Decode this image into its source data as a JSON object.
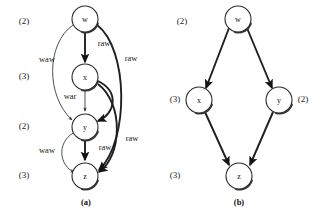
{
  "figure": {
    "panels": [
      {
        "id": "panel-a",
        "caption": "(a)",
        "nodes": [
          {
            "id": "w",
            "label": "w",
            "cx": 85,
            "cy": 19,
            "r": 13,
            "latency": "(2)",
            "latency_x": 24,
            "latency_y": 22,
            "latency_side": "left"
          },
          {
            "id": "x",
            "label": "x",
            "cx": 85,
            "cy": 77,
            "r": 13,
            "latency": "(3)",
            "latency_x": 24,
            "latency_y": 77,
            "latency_side": "left"
          },
          {
            "id": "y",
            "label": "y",
            "cx": 85,
            "cy": 127,
            "r": 13,
            "latency": "(2)",
            "latency_x": 24,
            "latency_y": 127,
            "latency_side": "left"
          },
          {
            "id": "z",
            "label": "z",
            "cx": 85,
            "cy": 176,
            "r": 13,
            "latency": "(3)",
            "latency_x": 24,
            "latency_y": 176,
            "latency_side": "left"
          }
        ],
        "edges": [
          {
            "id": "w-x-raw",
            "from": "w",
            "to": "x",
            "label": "raw",
            "label_x": 104,
            "label_y": 44,
            "weight": "thick"
          },
          {
            "id": "w-y-waw",
            "from": "w",
            "to": "y",
            "label": "waw",
            "label_x": 47,
            "label_y": 60,
            "weight": "thin"
          },
          {
            "id": "w-z-raw",
            "from": "w",
            "to": "z",
            "label": "raw",
            "label_x": 131,
            "label_y": 59,
            "weight": "thick"
          },
          {
            "id": "x-y-war",
            "from": "x",
            "to": "y",
            "label": "war",
            "label_x": 70,
            "label_y": 97,
            "weight": "thin"
          },
          {
            "id": "x-y-raw-curve",
            "from": "x",
            "to": "y",
            "label": "",
            "label_x": 0,
            "label_y": 0,
            "weight": "thick"
          },
          {
            "id": "y-z-raw",
            "from": "y",
            "to": "z",
            "label": "raw",
            "label_x": 105,
            "label_y": 148,
            "weight": "thick"
          },
          {
            "id": "y-z-waw",
            "from": "y",
            "to": "z",
            "label": "waw",
            "label_x": 47,
            "label_y": 151,
            "weight": "thin"
          },
          {
            "id": "x-z-raw",
            "from": "x",
            "to": "z",
            "label": "raw",
            "label_x": 132,
            "label_y": 139,
            "weight": "thick"
          }
        ]
      },
      {
        "id": "panel-b",
        "caption": "(b)",
        "nodes": [
          {
            "id": "w",
            "label": "w",
            "cx": 238,
            "cy": 19,
            "r": 13,
            "latency": "(2)",
            "latency_x": 182,
            "latency_y": 22,
            "latency_side": "left"
          },
          {
            "id": "x",
            "label": "x",
            "cx": 199,
            "cy": 100,
            "r": 13,
            "latency": "(3)",
            "latency_x": 175,
            "latency_y": 100,
            "latency_side": "left"
          },
          {
            "id": "y",
            "label": "y",
            "cx": 279,
            "cy": 100,
            "r": 13,
            "latency": "(2)",
            "latency_x": 303,
            "latency_y": 100,
            "latency_side": "right"
          },
          {
            "id": "z",
            "label": "z",
            "cx": 239,
            "cy": 176,
            "r": 13,
            "latency": "(3)",
            "latency_x": 175,
            "latency_y": 176,
            "latency_side": "left"
          }
        ],
        "edges": [
          {
            "id": "w-x",
            "from": "w",
            "to": "x",
            "label": "",
            "label_x": 0,
            "label_y": 0,
            "weight": "thick"
          },
          {
            "id": "w-y",
            "from": "w",
            "to": "y",
            "label": "",
            "label_x": 0,
            "label_y": 0,
            "weight": "thick"
          },
          {
            "id": "x-z",
            "from": "x",
            "to": "z",
            "label": "",
            "label_x": 0,
            "label_y": 0,
            "weight": "thick"
          },
          {
            "id": "y-z",
            "from": "y",
            "to": "z",
            "label": "",
            "label_x": 0,
            "label_y": 0,
            "weight": "thick"
          }
        ]
      }
    ],
    "captions": [
      {
        "id": "caption-a",
        "text": "(a)",
        "x": 86,
        "y": 203
      },
      {
        "id": "caption-b",
        "text": "(b)",
        "x": 239,
        "y": 203
      }
    ],
    "colors": {
      "background": "#ffffff",
      "node_stroke": "#2a2a2a",
      "node_fill": "#ffffff",
      "edge_stroke": "#1f1f1f",
      "text": "#1a1a1a"
    }
  }
}
